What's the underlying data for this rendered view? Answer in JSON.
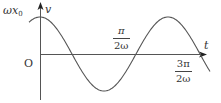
{
  "diagram": {
    "type": "cosine-velocity-time-graph",
    "axes": {
      "y_label": "v",
      "x_label": "t",
      "origin_label": "O"
    },
    "labels": {
      "amplitude": {
        "main": "ωx",
        "sub": "0"
      },
      "tick1": {
        "num": "π",
        "den": "2ω"
      },
      "tick2": {
        "num": "3π",
        "den": "2ω"
      }
    },
    "curve": {
      "function": "v = ωx0 cos(ωt)",
      "x_start_px": 29,
      "x_end_px": 210,
      "origin_px": [
        40,
        54
      ],
      "period_px": 128,
      "amplitude_px": 37
    },
    "colors": {
      "axis": "#444444",
      "curve": "#555555",
      "text": "#333333"
    }
  }
}
